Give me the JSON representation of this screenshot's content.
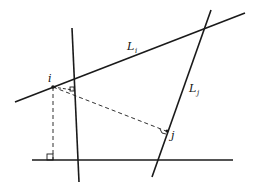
{
  "diagram": {
    "type": "geometric-construction",
    "colors": {
      "line": "#1a1a1a",
      "background": "#ffffff"
    },
    "labels": {
      "line_i": {
        "main": "L",
        "sub": "i"
      },
      "line_j": {
        "main": "L",
        "sub": "j"
      },
      "point_i": "i",
      "point_j": "j"
    },
    "lines": [
      {
        "name": "L_i",
        "style": "solid",
        "from": [
          15,
          102
        ],
        "to": [
          245,
          13
        ]
      },
      {
        "name": "L_j",
        "style": "solid",
        "from": [
          211,
          10
        ],
        "to": [
          152,
          177
        ]
      },
      {
        "name": "vertical-line",
        "style": "solid",
        "from": [
          72,
          28
        ],
        "to": [
          79,
          182
        ]
      },
      {
        "name": "horizontal-line",
        "style": "solid",
        "from": [
          32,
          160
        ],
        "to": [
          233,
          160
        ]
      },
      {
        "name": "perpendicular-i-to-j",
        "style": "dashed",
        "from": [
          53,
          87
        ],
        "to": [
          167,
          131
        ]
      },
      {
        "name": "perpendicular-i-to-vertical",
        "style": "dashed",
        "from": [
          53,
          87
        ],
        "to": [
          73,
          90
        ]
      },
      {
        "name": "perpendicular-i-to-horizontal",
        "style": "dashed",
        "from": [
          53,
          87
        ],
        "to": [
          53,
          160
        ]
      }
    ],
    "points": [
      {
        "name": "i",
        "at": [
          53,
          87
        ]
      },
      {
        "name": "j",
        "at": [
          167,
          131
        ]
      }
    ],
    "right_angle_marks": [
      {
        "at": [
          71,
          89
        ]
      },
      {
        "at": [
          163,
          131
        ]
      },
      {
        "at": [
          48,
          155
        ]
      }
    ]
  }
}
